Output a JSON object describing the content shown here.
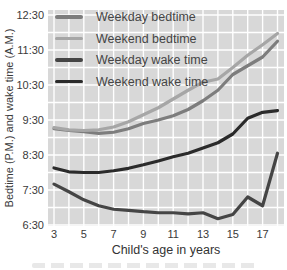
{
  "chart_data": {
    "type": "line",
    "title": "",
    "xlabel": "Child's age in years",
    "ylabel": "Bedtime (P.M.) and wake time (A.M.)",
    "x": [
      3,
      4,
      5,
      6,
      7,
      8,
      9,
      10,
      11,
      12,
      13,
      14,
      15,
      16,
      17,
      18
    ],
    "series": [
      {
        "name": "Weekday bedtime",
        "color": "#7d7d7d",
        "unit": "P.M. clock time, decimal hours",
        "values": [
          9.25,
          9.2,
          9.17,
          9.12,
          9.15,
          9.25,
          9.4,
          9.5,
          9.62,
          9.8,
          10.05,
          10.35,
          10.8,
          11.05,
          11.3,
          11.75
        ]
      },
      {
        "name": "Weekend bedtime",
        "color": "#a6a6a6",
        "unit": "P.M. clock time, decimal hours",
        "values": [
          9.28,
          9.22,
          9.2,
          9.22,
          9.3,
          9.45,
          9.65,
          9.85,
          10.1,
          10.35,
          10.58,
          10.67,
          11.0,
          11.35,
          11.65,
          11.97
        ]
      },
      {
        "name": "Weekday wake time",
        "color": "#454545",
        "unit": "A.M. clock time, decimal hours",
        "values": [
          7.67,
          7.45,
          7.22,
          7.05,
          6.95,
          6.92,
          6.88,
          6.85,
          6.85,
          6.82,
          6.85,
          6.68,
          6.8,
          7.3,
          7.05,
          8.55
        ]
      },
      {
        "name": "Weekend wake time",
        "color": "#2b2b2b",
        "unit": "A.M. clock time, decimal hours",
        "values": [
          8.13,
          8.02,
          8.0,
          8.0,
          8.05,
          8.12,
          8.22,
          8.33,
          8.45,
          8.55,
          8.7,
          8.85,
          9.1,
          9.55,
          9.72,
          9.77
        ]
      }
    ],
    "y_ticks": [
      "12:30",
      "11:30",
      "10:30",
      "9:30",
      "8:30",
      "7:30",
      "6:30"
    ],
    "y_tick_values": [
      12.5,
      11.5,
      10.5,
      9.5,
      8.5,
      7.5,
      6.5
    ],
    "x_ticks": [
      "3",
      "5",
      "7",
      "9",
      "11",
      "13",
      "15",
      "17"
    ],
    "x_tick_values": [
      3,
      5,
      7,
      9,
      11,
      13,
      15,
      17
    ],
    "ylim": [
      6.5,
      12.5
    ],
    "xlim": [
      2.6,
      18.8
    ],
    "grid": "on (white gridlines: 30-minute horizontal, 1-year vertical, on gray panel)",
    "legend_position": "top-left inside plot area",
    "colors": {
      "panel_background": "#d8d8d8",
      "grid": "#ffffff",
      "tick_text": "#3a3a3a",
      "axis_title_text": "#333333"
    }
  }
}
